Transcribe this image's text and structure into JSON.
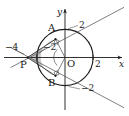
{
  "figure": {
    "kind": "geometry-diagram",
    "background_color": "#ffffff",
    "stroke_color": "#1a1a1a",
    "shade_color": "#b8b8b8",
    "axes": {
      "x_label": "x",
      "y_label": "y",
      "origin_label": "O"
    },
    "ticks": {
      "x_neg_four": "−4",
      "x_neg_two": "−2",
      "x_pos_two": "2",
      "y_pos_two": "2",
      "y_neg_two": "−2"
    },
    "points": {
      "a": "A",
      "b": "B",
      "p": "P"
    },
    "geometry": {
      "circle_center": "O",
      "circle_radius": 2,
      "point_p": [
        -4,
        0
      ],
      "point_a": [
        -1,
        1.7320508
      ],
      "point_b": [
        -1,
        -1.7320508
      ],
      "tangent_lines": 2,
      "right_angle_marks": [
        "A",
        "B"
      ],
      "angle_mark_at_o": true
    }
  }
}
